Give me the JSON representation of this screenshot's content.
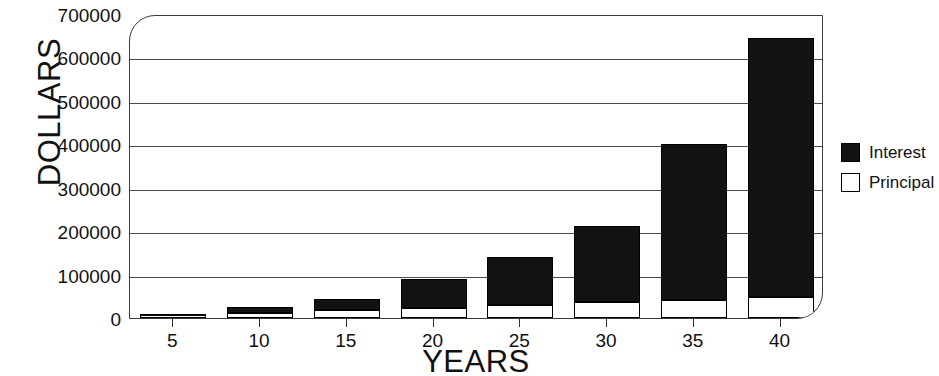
{
  "chart_data": {
    "type": "bar",
    "title": "",
    "subtitle": "",
    "xlabel": "YEARS",
    "ylabel": "DOLLARS",
    "categories": [
      "5",
      "10",
      "15",
      "20",
      "25",
      "30",
      "35",
      "40"
    ],
    "x": [
      5,
      10,
      15,
      20,
      25,
      30,
      35,
      40
    ],
    "stacked": true,
    "series": [
      {
        "name": "Principal",
        "color": "#ffffff",
        "values": [
          6000,
          12000,
          18000,
          24000,
          30000,
          36000,
          42000,
          48000
        ]
      },
      {
        "name": "Interest",
        "color": "#121212",
        "values": [
          3000,
          14000,
          26000,
          66000,
          110000,
          176000,
          358000,
          596000
        ]
      }
    ],
    "totals": [
      9000,
      26000,
      44000,
      90000,
      140000,
      212000,
      400000,
      644000
    ],
    "ylim": [
      0,
      700000
    ],
    "yticks": [
      0,
      100000,
      200000,
      300000,
      400000,
      500000,
      600000,
      700000
    ],
    "ytick_labels": [
      "0",
      "100000",
      "200000",
      "300000",
      "400000",
      "500000",
      "600000",
      "700000"
    ],
    "xtick_labels": [
      "5",
      "10",
      "15",
      "20",
      "25",
      "30",
      "35",
      "40"
    ],
    "grid": "horizontal",
    "legend_position": "right",
    "legend": [
      {
        "label": "Interest",
        "swatch": "filled",
        "color": "#121212"
      },
      {
        "label": "Principal",
        "swatch": "hollow",
        "color": "#ffffff"
      }
    ]
  }
}
